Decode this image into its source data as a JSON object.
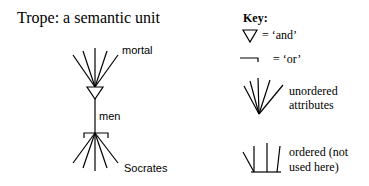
{
  "title": "Trope: a semantic unit",
  "diagram": {
    "labels": {
      "top": "mortal",
      "middle": "men",
      "bottom": "Socrates"
    }
  },
  "key": {
    "heading": "Key:",
    "and_label": "= ‘and’",
    "or_label": "= ‘or’",
    "unordered_line1": "unordered",
    "unordered_line2": "attributes",
    "ordered_line1": "ordered (not",
    "ordered_line2": "used here)"
  }
}
